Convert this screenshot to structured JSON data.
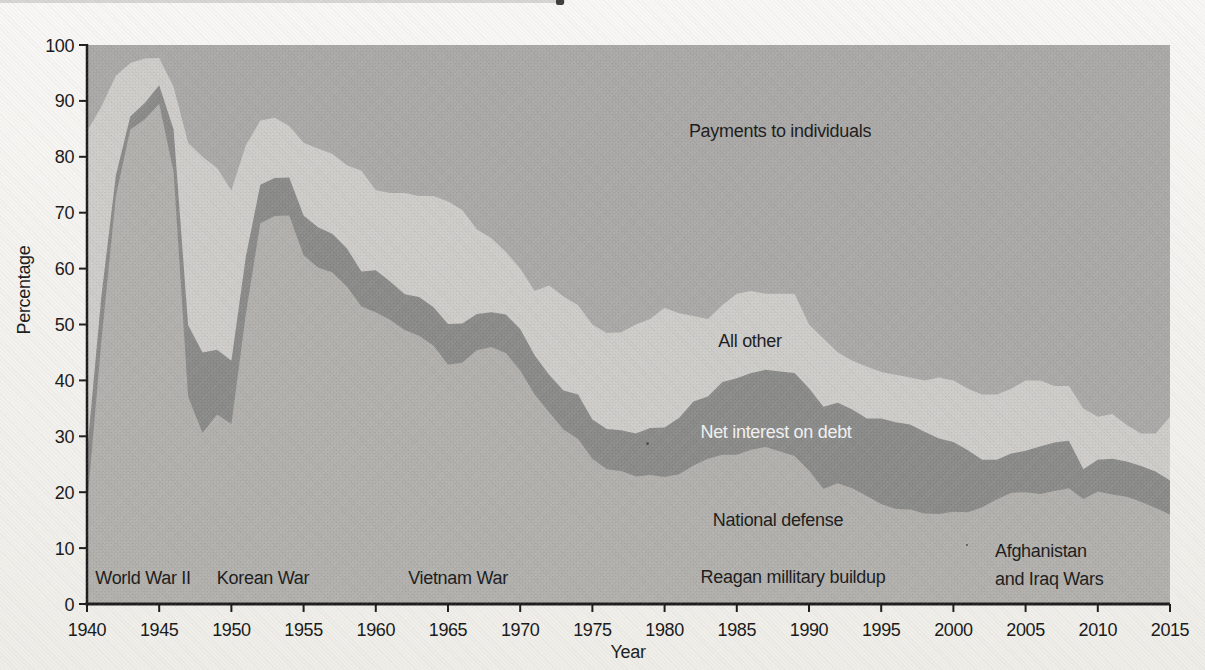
{
  "chart_data": {
    "type": "area",
    "stacked": true,
    "stack_total": 100,
    "xlabel": "Year",
    "ylabel": "Percentage",
    "xlim": [
      1940,
      2015
    ],
    "ylim": [
      0,
      100
    ],
    "grid": false,
    "x_ticks": [
      1940,
      1945,
      1950,
      1955,
      1960,
      1965,
      1970,
      1975,
      1980,
      1985,
      1990,
      1995,
      2000,
      2005,
      2010,
      2015
    ],
    "y_ticks": [
      0,
      10,
      20,
      30,
      40,
      50,
      60,
      70,
      80,
      90,
      100
    ],
    "x": [
      1940,
      1941,
      1942,
      1943,
      1944,
      1945,
      1946,
      1947,
      1948,
      1949,
      1950,
      1951,
      1952,
      1953,
      1954,
      1955,
      1956,
      1957,
      1958,
      1959,
      1960,
      1961,
      1962,
      1963,
      1964,
      1965,
      1966,
      1967,
      1968,
      1969,
      1970,
      1971,
      1972,
      1973,
      1974,
      1975,
      1976,
      1977,
      1978,
      1979,
      1980,
      1981,
      1982,
      1983,
      1984,
      1985,
      1986,
      1987,
      1988,
      1989,
      1990,
      1991,
      1992,
      1993,
      1994,
      1995,
      1996,
      1997,
      1998,
      1999,
      2000,
      2001,
      2002,
      2003,
      2004,
      2005,
      2006,
      2007,
      2008,
      2009,
      2010,
      2011,
      2012,
      2013,
      2014,
      2015
    ],
    "series": [
      {
        "name": "National defense",
        "color": "#b1b0ad",
        "values": [
          17.5,
          47.1,
          73.0,
          84.9,
          86.7,
          89.5,
          77.3,
          37.1,
          30.6,
          33.9,
          32.2,
          51.8,
          68.1,
          69.4,
          69.5,
          62.4,
          60.2,
          59.3,
          56.8,
          53.2,
          52.2,
          50.8,
          49.0,
          48.0,
          46.2,
          42.8,
          43.2,
          45.4,
          46.0,
          44.9,
          41.8,
          37.5,
          34.3,
          31.2,
          29.5,
          26.0,
          24.1,
          23.8,
          22.8,
          23.1,
          22.7,
          23.2,
          24.8,
          26.0,
          26.7,
          26.7,
          27.6,
          28.1,
          27.3,
          26.5,
          23.9,
          20.6,
          21.6,
          20.7,
          19.3,
          17.9,
          17.0,
          16.9,
          16.2,
          16.1,
          16.5,
          16.4,
          17.3,
          18.7,
          19.9,
          20.0,
          19.7,
          20.2,
          20.7,
          18.8,
          20.1,
          19.6,
          19.2,
          18.3,
          17.2,
          16.0
        ]
      },
      {
        "name": "Net interest on debt",
        "color": "#8a8a89",
        "values": [
          9.5,
          8.0,
          3.7,
          2.3,
          2.9,
          3.3,
          7.6,
          12.8,
          14.4,
          11.6,
          11.3,
          10.3,
          6.9,
          6.8,
          6.8,
          7.1,
          7.2,
          6.9,
          6.8,
          6.3,
          7.5,
          6.9,
          6.4,
          6.9,
          6.9,
          7.3,
          7.0,
          6.5,
          6.2,
          6.9,
          7.4,
          7.0,
          6.7,
          7.0,
          8.0,
          7.0,
          7.2,
          7.3,
          7.7,
          8.4,
          8.9,
          10.1,
          11.4,
          11.1,
          13.0,
          13.7,
          13.7,
          13.8,
          14.3,
          14.8,
          14.7,
          14.7,
          14.4,
          14.1,
          13.9,
          15.3,
          15.5,
          15.2,
          14.6,
          13.5,
          12.5,
          11.1,
          8.5,
          7.1,
          7.0,
          7.4,
          8.5,
          8.7,
          8.5,
          5.3,
          5.7,
          6.4,
          6.3,
          6.4,
          6.5,
          6.1
        ]
      },
      {
        "name": "All other",
        "color": "#cdccc9",
        "values": [
          57.5,
          33.9,
          17.8,
          9.6,
          8.0,
          4.9,
          7.6,
          32.6,
          35.0,
          32.5,
          30.5,
          19.9,
          11.5,
          10.8,
          9.2,
          13.0,
          14.1,
          14.3,
          14.9,
          18.0,
          14.3,
          15.8,
          18.1,
          18.1,
          19.9,
          21.9,
          20.3,
          15.1,
          13.3,
          11.2,
          10.8,
          11.5,
          16.0,
          16.8,
          16.0,
          17.0,
          17.2,
          17.5,
          19.5,
          19.5,
          21.4,
          18.7,
          15.3,
          13.9,
          13.8,
          15.1,
          14.7,
          13.6,
          13.9,
          14.2,
          11.4,
          12.2,
          9.0,
          8.7,
          9.3,
          8.3,
          8.5,
          8.4,
          9.2,
          10.9,
          11.0,
          11.0,
          11.7,
          11.7,
          11.6,
          12.6,
          11.8,
          10.1,
          9.8,
          10.9,
          7.7,
          8.0,
          6.5,
          5.8,
          6.8,
          11.4
        ]
      },
      {
        "name": "Payments to individuals",
        "color": "#aaa9a7",
        "values": [
          15.5,
          11.0,
          5.5,
          3.2,
          2.4,
          2.3,
          7.5,
          17.5,
          20.0,
          22.0,
          26.0,
          18.0,
          13.5,
          13.0,
          14.5,
          17.5,
          18.5,
          19.5,
          21.5,
          22.5,
          26.0,
          26.5,
          26.5,
          27.0,
          27.0,
          28.0,
          29.5,
          33.0,
          34.5,
          37.0,
          40.0,
          44.0,
          43.0,
          45.0,
          46.5,
          50.0,
          51.5,
          51.4,
          50.0,
          49.0,
          47.0,
          48.0,
          48.5,
          49.0,
          46.5,
          44.5,
          44.0,
          44.5,
          44.5,
          44.5,
          50.0,
          52.5,
          55.0,
          56.5,
          57.5,
          58.5,
          59.0,
          59.5,
          60.0,
          59.5,
          60.0,
          61.5,
          62.5,
          62.5,
          61.5,
          60.0,
          60.0,
          61.0,
          61.0,
          65.0,
          66.5,
          66.0,
          68.0,
          69.5,
          69.5,
          66.5
        ]
      }
    ],
    "series_labels": [
      {
        "id": "payments",
        "text": "Payments to individuals",
        "x": 1988.0,
        "y": 84.6
      },
      {
        "id": "all-other",
        "text": "All other",
        "x": 1985.9,
        "y": 47.0
      },
      {
        "id": "net-interest",
        "text": "Net interest on debt",
        "x": 1987.7,
        "y": 30.8,
        "color": "#f2f2f2"
      },
      {
        "id": "national-defense",
        "text": "National defense",
        "x": 1987.8,
        "y": 15.0
      }
    ],
    "annotations": [
      {
        "id": "world-war-ii",
        "text": "World War II",
        "x": 1943.9,
        "y": 4.6
      },
      {
        "id": "korean-war",
        "text": "Korean War",
        "x": 1952.2,
        "y": 4.6
      },
      {
        "id": "vietnam-war",
        "text": "Vietnam War",
        "x": 1965.7,
        "y": 4.6
      },
      {
        "id": "reagan-buildup",
        "text": "Reagan millitary buildup",
        "x": 1988.9,
        "y": 4.8
      },
      {
        "id": "afghanistan-iraq",
        "lines": [
          "Afghanistan",
          "and Iraq Wars"
        ],
        "x": 2007.1,
        "y": 7.5
      }
    ],
    "axis_color": "#1c1c1c"
  }
}
